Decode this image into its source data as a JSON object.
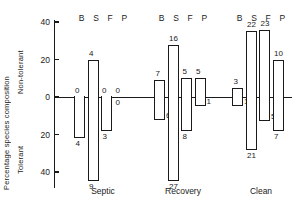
{
  "axis": {
    "ylabel_main": "Percentage species composition",
    "ylabel_upper": "Non-tolerant",
    "ylabel_lower": "Tolerant",
    "ticks": [
      "40",
      "20",
      "0",
      "20",
      "40"
    ]
  },
  "group_header": "B S F P",
  "groups": [
    {
      "name": "Septic"
    },
    {
      "name": "Recovery"
    },
    {
      "name": "Clean"
    }
  ],
  "chart_data": {
    "type": "bar",
    "title": "",
    "subtitle": "",
    "xlabel": "",
    "ylabel": "Percentage species composition",
    "orientation": "vertical",
    "grid": false,
    "legend": "none",
    "axis_upper_label": "Non-tolerant",
    "axis_lower_label": "Tolerant",
    "ylim": [
      -50,
      45
    ],
    "ytick_values": [
      40,
      20,
      0,
      -20,
      -40
    ],
    "ytick_labels": [
      "40",
      "20",
      "0",
      "20",
      "40"
    ],
    "taxa_codes": [
      "B",
      "S",
      "F",
      "P"
    ],
    "categories": [
      "Septic",
      "Recovery",
      "Clean"
    ],
    "note": "Bars extend up for non-tolerant and down for tolerant percentage; annotation beside each bar is the number of species.",
    "series": [
      {
        "name": "Septic",
        "bars": [
          {
            "code": "B",
            "nontolerant_pct": 0,
            "nontolerant_label": "0",
            "tolerant_pct": -22,
            "tolerant_label": "4"
          },
          {
            "code": "S",
            "nontolerant_pct": 20,
            "nontolerant_label": "4",
            "tolerant_pct": -45,
            "tolerant_label": "9"
          },
          {
            "code": "F",
            "nontolerant_pct": 0,
            "nontolerant_label": "0",
            "tolerant_pct": -18,
            "tolerant_label": "3"
          },
          {
            "code": "P",
            "nontolerant_pct": 0,
            "nontolerant_label": "0",
            "tolerant_pct": 0,
            "tolerant_label": "0"
          }
        ]
      },
      {
        "name": "Recovery",
        "bars": [
          {
            "code": "B",
            "nontolerant_pct": 9,
            "nontolerant_label": "7",
            "tolerant_pct": -12,
            "tolerant_label": "6"
          },
          {
            "code": "S",
            "nontolerant_pct": 28,
            "nontolerant_label": "16",
            "tolerant_pct": -45,
            "tolerant_label": "27"
          },
          {
            "code": "F",
            "nontolerant_pct": 10,
            "nontolerant_label": "5",
            "tolerant_pct": -18,
            "tolerant_label": "8"
          },
          {
            "code": "P",
            "nontolerant_pct": 10,
            "nontolerant_label": "5",
            "tolerant_pct": -5,
            "tolerant_label": "1"
          }
        ]
      },
      {
        "name": "Clean",
        "bars": [
          {
            "code": "B",
            "nontolerant_pct": 5,
            "nontolerant_label": "3",
            "tolerant_pct": -5,
            "tolerant_label": "1"
          },
          {
            "code": "S",
            "nontolerant_pct": 35,
            "nontolerant_label": "22",
            "tolerant_pct": -28,
            "tolerant_label": "21"
          },
          {
            "code": "F",
            "nontolerant_pct": 36,
            "nontolerant_label": "23",
            "tolerant_pct": -13,
            "tolerant_label": "5"
          },
          {
            "code": "P",
            "nontolerant_pct": 20,
            "nontolerant_label": "10",
            "tolerant_pct": -18,
            "tolerant_label": "7"
          }
        ]
      }
    ]
  }
}
